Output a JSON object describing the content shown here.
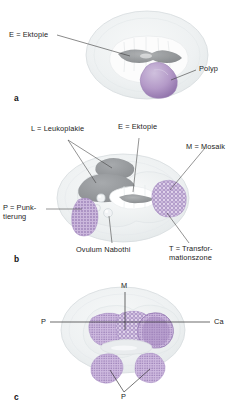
{
  "figure": {
    "background_color": "#ffffff",
    "panels": [
      {
        "id": "a",
        "letter": "a",
        "labels": [
          {
            "key": "ektopie",
            "text": "E = Ektopie"
          },
          {
            "key": "polyp",
            "text": "Polyp"
          }
        ]
      },
      {
        "id": "b",
        "letter": "b",
        "labels": [
          {
            "key": "leukoplakie",
            "text": "L = Leukoplakie"
          },
          {
            "key": "ektopie",
            "text": "E = Ektopie"
          },
          {
            "key": "mosaik",
            "text": "M = Mosaik"
          },
          {
            "key": "punktierung",
            "text": "P = Punk-\ntierung"
          },
          {
            "key": "ovulum",
            "text": "Ovulum Nabothi"
          },
          {
            "key": "transformationszone",
            "text": "T = Transfor-\nmationszone"
          }
        ]
      },
      {
        "id": "c",
        "letter": "c",
        "labels": [
          {
            "key": "mosaik",
            "text": "M"
          },
          {
            "key": "punktierung_left",
            "text": "P"
          },
          {
            "key": "carcinoma",
            "text": "Ca"
          },
          {
            "key": "punktierung_bottom",
            "text": "P"
          }
        ]
      }
    ],
    "colors": {
      "portio_body": "#eceff0",
      "portio_edge": "#d3d8da",
      "ektopie_gray": "#8c8f92",
      "leukoplakie_gray": "#9a9da0",
      "lesion_violet": "#b49ac8",
      "lesion_violet_dark": "#8d6fa8",
      "os_white": "#fbfbfb",
      "leader_line": "#3b3b3b",
      "text": "#1c1c1c"
    }
  }
}
